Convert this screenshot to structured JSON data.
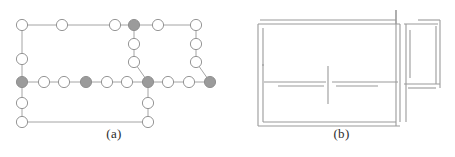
{
  "figure": {
    "background_color": "#ffffff",
    "panels": [
      {
        "id": "panel-a",
        "caption": "(a)",
        "type": "graph",
        "description": "Node-link grid graph with white and gray vertices"
      },
      {
        "id": "panel-b",
        "caption": "(b)",
        "type": "floorplan",
        "description": "Floor plan wall segments forming rooms"
      }
    ]
  },
  "graph": {
    "node_fill_plain": "#ffffff",
    "node_fill_marked": "#9b9b9b",
    "node_stroke": "#8a8a8a",
    "edge_color": "#9a9a9a",
    "node_radius": 5.6,
    "nodes": [
      {
        "id": "n1",
        "x": 22,
        "y": 25,
        "state": "plain"
      },
      {
        "id": "n2",
        "x": 62,
        "y": 25,
        "state": "plain"
      },
      {
        "id": "n3",
        "x": 115,
        "y": 25,
        "state": "plain"
      },
      {
        "id": "n4",
        "x": 134,
        "y": 25,
        "state": "marked"
      },
      {
        "id": "n5",
        "x": 158,
        "y": 25,
        "state": "plain"
      },
      {
        "id": "n6",
        "x": 196,
        "y": 25,
        "state": "plain"
      },
      {
        "id": "n7",
        "x": 22,
        "y": 59,
        "state": "plain"
      },
      {
        "id": "n8",
        "x": 134,
        "y": 44,
        "state": "plain"
      },
      {
        "id": "n9",
        "x": 134,
        "y": 62,
        "state": "plain"
      },
      {
        "id": "n10",
        "x": 196,
        "y": 44,
        "state": "plain"
      },
      {
        "id": "n11",
        "x": 196,
        "y": 62,
        "state": "plain"
      },
      {
        "id": "n12",
        "x": 22,
        "y": 82,
        "state": "marked"
      },
      {
        "id": "n13",
        "x": 44,
        "y": 82,
        "state": "plain"
      },
      {
        "id": "n14",
        "x": 64,
        "y": 82,
        "state": "plain"
      },
      {
        "id": "n15",
        "x": 86,
        "y": 82,
        "state": "marked"
      },
      {
        "id": "n16",
        "x": 107,
        "y": 82,
        "state": "plain"
      },
      {
        "id": "n17",
        "x": 127,
        "y": 82,
        "state": "plain"
      },
      {
        "id": "n18",
        "x": 148,
        "y": 82,
        "state": "marked"
      },
      {
        "id": "n19",
        "x": 168,
        "y": 82,
        "state": "plain"
      },
      {
        "id": "n20",
        "x": 189,
        "y": 82,
        "state": "plain"
      },
      {
        "id": "n21",
        "x": 210,
        "y": 82,
        "state": "marked"
      },
      {
        "id": "n22",
        "x": 22,
        "y": 103,
        "state": "plain"
      },
      {
        "id": "n23",
        "x": 22,
        "y": 122,
        "state": "plain"
      },
      {
        "id": "n24",
        "x": 148,
        "y": 103,
        "state": "plain"
      },
      {
        "id": "n25",
        "x": 148,
        "y": 122,
        "state": "plain"
      }
    ],
    "edges": [
      {
        "from": "n1",
        "to": "n2"
      },
      {
        "from": "n2",
        "to": "n3"
      },
      {
        "from": "n3",
        "to": "n4"
      },
      {
        "from": "n4",
        "to": "n5"
      },
      {
        "from": "n5",
        "to": "n6"
      },
      {
        "from": "n1",
        "to": "n7"
      },
      {
        "from": "n7",
        "to": "n12"
      },
      {
        "from": "n4",
        "to": "n8"
      },
      {
        "from": "n8",
        "to": "n9"
      },
      {
        "from": "n9",
        "to": "n18"
      },
      {
        "from": "n6",
        "to": "n10"
      },
      {
        "from": "n10",
        "to": "n11"
      },
      {
        "from": "n11",
        "to": "n21"
      },
      {
        "from": "n12",
        "to": "n13"
      },
      {
        "from": "n13",
        "to": "n14"
      },
      {
        "from": "n14",
        "to": "n15"
      },
      {
        "from": "n15",
        "to": "n16"
      },
      {
        "from": "n16",
        "to": "n17"
      },
      {
        "from": "n17",
        "to": "n18"
      },
      {
        "from": "n18",
        "to": "n19"
      },
      {
        "from": "n19",
        "to": "n20"
      },
      {
        "from": "n20",
        "to": "n21"
      },
      {
        "from": "n12",
        "to": "n22"
      },
      {
        "from": "n22",
        "to": "n23"
      },
      {
        "from": "n18",
        "to": "n24"
      },
      {
        "from": "n24",
        "to": "n25"
      },
      {
        "from": "n23",
        "to": "n25"
      }
    ]
  },
  "floorplan": {
    "wall_color": "#9a9a9a",
    "wall_thickness": 1.1,
    "walls": [
      {
        "id": "w-top-left-outer",
        "x1": 32,
        "y1": 20,
        "x2": 168,
        "y2": 20
      },
      {
        "id": "w-top-left-inner",
        "x1": 30,
        "y1": 24,
        "x2": 172,
        "y2": 24
      },
      {
        "id": "w-left-outer",
        "x1": 30,
        "y1": 24,
        "x2": 30,
        "y2": 126
      },
      {
        "id": "w-left-inner",
        "x1": 35,
        "y1": 28,
        "x2": 35,
        "y2": 122
      },
      {
        "id": "w-left-inner-gap",
        "x1": 35,
        "y1": 64,
        "x2": 35,
        "y2": 66
      },
      {
        "id": "w-bottom-outer",
        "x1": 30,
        "y1": 126,
        "x2": 172,
        "y2": 126
      },
      {
        "id": "w-bottom-inner",
        "x1": 35,
        "y1": 122,
        "x2": 168,
        "y2": 122
      },
      {
        "id": "w-mid-vert-outer",
        "x1": 168,
        "y1": 10,
        "x2": 168,
        "y2": 126
      },
      {
        "id": "w-mid-vert-inner",
        "x1": 172,
        "y1": 24,
        "x2": 172,
        "y2": 122
      },
      {
        "id": "w-mid-vert-upper",
        "x1": 168,
        "y1": 10,
        "x2": 168,
        "y2": 24
      },
      {
        "id": "w-right-top-outer",
        "x1": 176,
        "y1": 24,
        "x2": 210,
        "y2": 24
      },
      {
        "id": "w-right-top-inner",
        "x1": 190,
        "y1": 20,
        "x2": 212,
        "y2": 20
      },
      {
        "id": "w-right-outer",
        "x1": 212,
        "y1": 20,
        "x2": 212,
        "y2": 88
      },
      {
        "id": "w-right-inner",
        "x1": 208,
        "y1": 26,
        "x2": 208,
        "y2": 84
      },
      {
        "id": "w-right-bot-outer",
        "x1": 176,
        "y1": 84,
        "x2": 212,
        "y2": 84
      },
      {
        "id": "w-right-bot-inner",
        "x1": 180,
        "y1": 88,
        "x2": 208,
        "y2": 88
      },
      {
        "id": "w-interior-h-left",
        "x1": 36,
        "y1": 82,
        "x2": 98,
        "y2": 82
      },
      {
        "id": "w-interior-h-left2",
        "x1": 50,
        "y1": 86,
        "x2": 96,
        "y2": 86
      },
      {
        "id": "w-interior-h-right",
        "x1": 104,
        "y1": 82,
        "x2": 170,
        "y2": 82
      },
      {
        "id": "w-interior-h-right2",
        "x1": 108,
        "y1": 86,
        "x2": 150,
        "y2": 86
      },
      {
        "id": "w-interior-v-mid",
        "x1": 100,
        "y1": 66,
        "x2": 100,
        "y2": 104
      },
      {
        "id": "w-right-v-div",
        "x1": 178,
        "y1": 24,
        "x2": 178,
        "y2": 122
      },
      {
        "id": "w-right-v-div2",
        "x1": 182,
        "y1": 30,
        "x2": 182,
        "y2": 78
      }
    ]
  }
}
